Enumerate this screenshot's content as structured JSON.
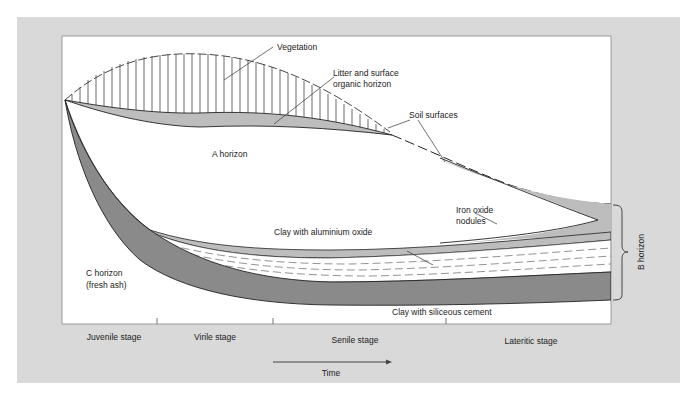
{
  "figure": {
    "labels": {
      "vegetation": "Vegetation",
      "litter_line1": "Litter and surface",
      "litter_line2": "organic horizon",
      "soil_surfaces": "Soil surfaces",
      "a_horizon": "A horizon",
      "iron_line1": "Iron oxide",
      "iron_line2": "nodules",
      "clay_aluminium": "Clay with aluminium oxide",
      "c_horizon_line1": "C horizon",
      "c_horizon_line2": "(fresh ash)",
      "clay_siliceous": "Clay with siliceous cement",
      "b_horizon": "B horizon"
    },
    "stages": [
      {
        "label": "Juvenile stage"
      },
      {
        "label": "Virile stage"
      },
      {
        "label": "Senile stage"
      },
      {
        "label": "Lateritic stage"
      }
    ],
    "time_label": "Time",
    "colors": {
      "panel_bg": "#d9d9d9",
      "plot_bg": "#ffffff",
      "light_gray_fill": "#bdbdbd",
      "dark_gray_fill": "#8a8a8a",
      "line": "#222222"
    }
  }
}
